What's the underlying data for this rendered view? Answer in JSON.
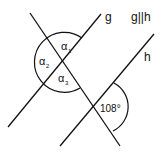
{
  "diagram": {
    "line_g_label": "g",
    "line_h_label": "h",
    "parallel_note": "g||h",
    "angles": {
      "alpha1": {
        "symbol": "α",
        "sub": "1"
      },
      "alpha2": {
        "symbol": "α",
        "sub": "2"
      },
      "alpha3": {
        "symbol": "α",
        "sub": "3"
      },
      "given": "108°"
    },
    "colors": {
      "stroke": "#111111",
      "background": "#ffffff"
    }
  }
}
